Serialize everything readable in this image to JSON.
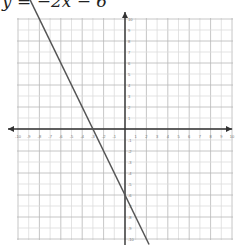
{
  "title": "y = −2x − 6",
  "chart_data": {
    "type": "line",
    "title": "y = −2x − 6",
    "equation": "y = -2x - 6",
    "series": [
      {
        "name": "y = -2x - 6",
        "x": [
          -8,
          2
        ],
        "y": [
          10,
          -10
        ]
      }
    ],
    "slope": -2,
    "y_intercept": -6,
    "x_intercept": -3,
    "xlim": [
      -10,
      10
    ],
    "ylim": [
      -10,
      10
    ],
    "xticks": [
      -10,
      -9,
      -8,
      -7,
      -6,
      -5,
      -4,
      -3,
      -2,
      -1,
      1,
      2,
      3,
      4,
      5,
      6,
      7,
      8,
      9,
      10
    ],
    "yticks": [
      -10,
      -9,
      -8,
      -7,
      -6,
      -5,
      -4,
      -3,
      -2,
      -1,
      1,
      2,
      3,
      4,
      5,
      6,
      7,
      8,
      9,
      10
    ],
    "grid": true,
    "xlabel": "",
    "ylabel": ""
  }
}
